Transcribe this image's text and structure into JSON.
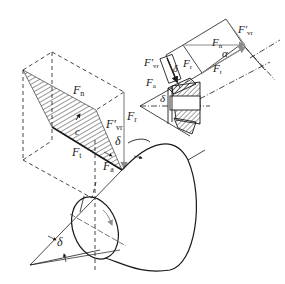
{
  "diagram": {
    "main_view": {
      "labels": {
        "Fn": {
          "base": "F",
          "sub": "n"
        },
        "Fvr": {
          "base": "F'",
          "sub": "vr"
        },
        "Fr": {
          "base": "F",
          "sub": "r"
        },
        "Ft": {
          "base": "F",
          "sub": "t"
        },
        "Fa": {
          "base": "F",
          "sub": "a"
        },
        "delta": "δ",
        "c": "c"
      },
      "cone_angle_label": "δ"
    },
    "inset_view": {
      "labels": {
        "Fn": {
          "base": "F",
          "sub": "n"
        },
        "Fvr_top": {
          "base": "F'",
          "sub": "vr"
        },
        "Fvr_left": {
          "base": "F'",
          "sub": "vr"
        },
        "Ft_right": {
          "base": "F",
          "sub": "t"
        },
        "Ft_small": {
          "base": "F",
          "sub": "r"
        },
        "Fa": {
          "base": "F",
          "sub": "a"
        },
        "alpha": "α",
        "delta_top": "δ",
        "delta_left": "δ"
      }
    },
    "colors": {
      "line": "#1a1a1a",
      "vector": "#8c8c8c",
      "background": "#ffffff"
    }
  }
}
